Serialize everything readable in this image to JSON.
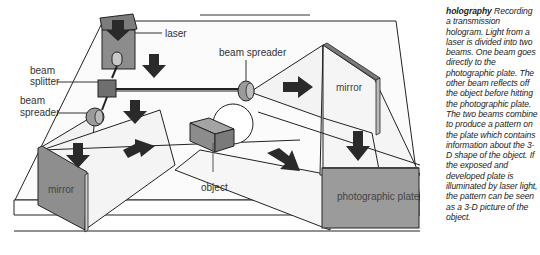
{
  "diagram": {
    "title": "holography",
    "labels": {
      "laser": "laser",
      "beam_splitter_1": "beam",
      "beam_splitter_2": "splitter",
      "beam_spreader_left_1": "beam",
      "beam_spreader_left_2": "spreader",
      "beam_spreader_top": "beam spreader",
      "mirror_right": "mirror",
      "mirror_left": "mirror",
      "object": "object",
      "photographic_plate": "photographic plate"
    },
    "colors": {
      "component_fill": "#8a8a8a",
      "arrow_fill": "#2a2a2a",
      "beam_fill": "#f4f4f4",
      "plate_fill": "#9a9a9a",
      "line": "#222222"
    }
  },
  "caption": {
    "term": "holography",
    "text": "Recording a transmission hologram. Light from a laser is divided into two beams. One beam goes directly to the photographic plate. The other beam reflects off the object before hitting the photographic plate. The two beams combine to produce a pattern on the plate which contains information about the 3-D shape of the object. If the exposed and developed plate is illuminated by laser light, the pattern can be seen as a 3-D picture of the object."
  }
}
